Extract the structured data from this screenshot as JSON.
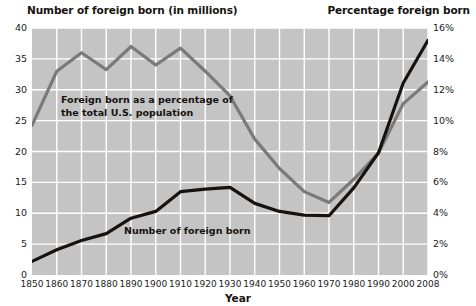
{
  "titles": {
    "left": "Number of foreign born (in millions)",
    "right": "Percentage foreign born",
    "xaxis": "Year"
  },
  "annotations": {
    "pct_line_1": "Foreign born as a percentage of",
    "pct_line_2": "the total U.S. population",
    "num_line": "Number of foreign born"
  },
  "colors": {
    "plot_background": "#c4c4c4",
    "gridline": "#ffffff",
    "percentage_line": "#7a7a7a",
    "number_line": "#16120f",
    "text": "#16120f"
  },
  "axes": {
    "left_ticks": [
      "0",
      "5",
      "10",
      "15",
      "20",
      "25",
      "30",
      "35",
      "40"
    ],
    "right_ticks": [
      "0%",
      "2%",
      "4%",
      "6%",
      "8%",
      "10%",
      "12%",
      "14%",
      "16%"
    ],
    "x_ticks": [
      "1850",
      "1860",
      "1870",
      "1880",
      "1890",
      "1900",
      "1910",
      "1920",
      "1930",
      "1940",
      "1950",
      "1960",
      "1970",
      "1980",
      "1990",
      "2000",
      "2008"
    ]
  },
  "chart_data": {
    "type": "line",
    "xlabel": "Year",
    "ylabel": "Number of foreign born (in millions)",
    "y2label": "Percentage foreign born",
    "ylim": [
      0,
      40
    ],
    "y2lim": [
      0,
      16
    ],
    "xlim": [
      1850,
      2008
    ],
    "grid": true,
    "legend": "annotations-inline",
    "x": [
      1850,
      1860,
      1870,
      1880,
      1890,
      1900,
      1910,
      1920,
      1930,
      1940,
      1950,
      1960,
      1970,
      1980,
      1990,
      2000,
      2008
    ],
    "series": [
      {
        "name": "Number of foreign born",
        "axis": "left",
        "units": "millions",
        "color": "#16120f",
        "values": [
          2.2,
          4.1,
          5.6,
          6.7,
          9.2,
          10.3,
          13.5,
          13.9,
          14.2,
          11.6,
          10.3,
          9.7,
          9.6,
          14.1,
          19.8,
          31.1,
          38.0
        ]
      },
      {
        "name": "Foreign born as a percentage of the total U.S. population",
        "axis": "right",
        "units": "percent",
        "color": "#7a7a7a",
        "values": [
          9.7,
          13.2,
          14.4,
          13.3,
          14.8,
          13.6,
          14.7,
          13.2,
          11.6,
          8.8,
          6.9,
          5.4,
          4.7,
          6.2,
          7.9,
          11.1,
          12.5
        ]
      }
    ]
  }
}
